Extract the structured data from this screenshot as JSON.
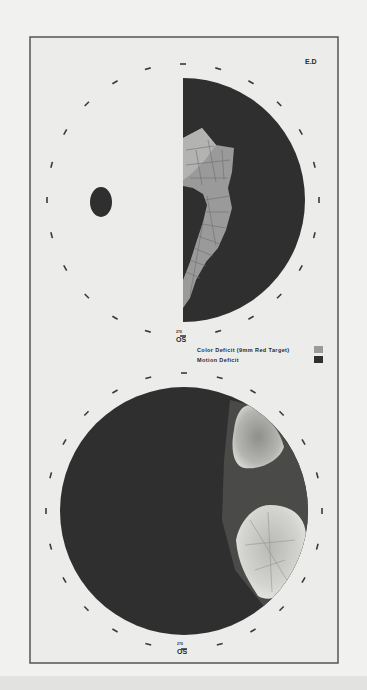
{
  "figure": {
    "subject_label": "E.D",
    "colors": {
      "page": "#f1f1ef",
      "frame": "#555555",
      "panel_bg": "#ececea",
      "motion_deficit": "#2f2f2f",
      "color_deficit": "#9a9a9a",
      "grid_line": "#6e6e6e",
      "tick": "#3a3a3a"
    },
    "top_plot": {
      "eye_label": "OS",
      "small_label": "270",
      "center": [
        183,
        200
      ],
      "radius": 122,
      "tick_radius": 136,
      "blind_spot": {
        "cx": 101,
        "cy": 202,
        "rx": 11,
        "ry": 15
      }
    },
    "legend": {
      "items": [
        {
          "label": "Color Deficit (9mm Red Target)",
          "swatch": "#9a9a9a"
        },
        {
          "label": "Motion Deficit",
          "swatch": "#2f2f2f"
        }
      ]
    },
    "bottom_plot": {
      "eye_label": "OS",
      "small_label": "270",
      "center": [
        184,
        511
      ],
      "radius": 124,
      "tick_radius": 138
    }
  }
}
